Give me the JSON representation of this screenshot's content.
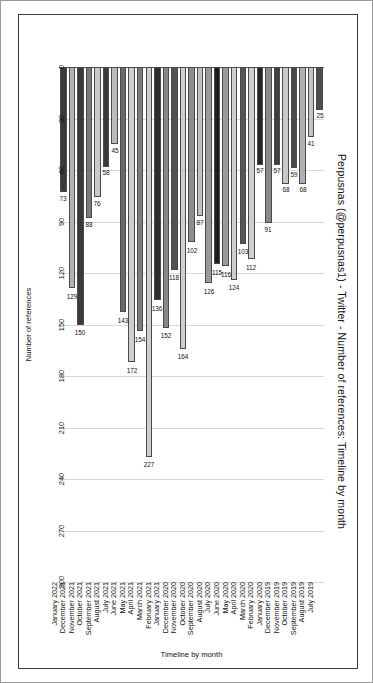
{
  "chart_data": {
    "type": "bar",
    "orientation": "horizontal",
    "title": "Perpusnas (@perpusnas1) - Twitter - Number of references: Timeline by month",
    "xlabel": "Timeline by month",
    "ylabel": "Number of references",
    "ylim": [
      0,
      300
    ],
    "yticks": [
      0,
      30,
      60,
      90,
      120,
      150,
      180,
      210,
      240,
      270,
      300
    ],
    "ytick_labels": [
      "0",
      "30",
      "60",
      "90",
      "120",
      "150",
      "180",
      "210",
      "240",
      "270",
      "300"
    ],
    "grid": true,
    "legend": null,
    "categories": [
      "July 2019",
      "August 2019",
      "September 2019",
      "October 2019",
      "November 2019",
      "December 2019",
      "January 2020",
      "February 2020",
      "March 2020",
      "April 2020",
      "May 2020",
      "June 2020",
      "July 2020",
      "August 2020",
      "September 2020",
      "October 2020",
      "November 2020",
      "December 2020",
      "January 2021",
      "February 2021",
      "March 2021",
      "April 2021",
      "May 2021",
      "June 2021",
      "July 2021",
      "August 2021",
      "September 2021",
      "October 2021",
      "November 2021",
      "December 2021",
      "January 2022"
    ],
    "values": [
      25,
      41,
      68,
      59,
      68,
      57,
      91,
      57,
      112,
      103,
      124,
      116,
      115,
      126,
      87,
      102,
      164,
      118,
      152,
      136,
      227,
      154,
      172,
      143,
      45,
      58,
      76,
      88,
      150,
      129,
      73
    ],
    "bar_colors": [
      "#4d4d4d",
      "#c4c4c4",
      "#b0b0b0",
      "#4a4a4a",
      "#c9c9c9",
      "#3f3f3f",
      "#8a8a8a",
      "#262626",
      "#cfcfcf",
      "#555555",
      "#cecece",
      "#9b9b9b",
      "#1c1c1c",
      "#9a9a9a",
      "#c2c2c2",
      "#8d8d8d",
      "#cfcfcf",
      "#525252",
      "#888888",
      "#2c2c2c",
      "#cfcfcf",
      "#7d7d7d",
      "#cfcfcf",
      "#6a6a6a",
      "#bbbbbb",
      "#3a3a3a",
      "#c9c9c9",
      "#7a7a7a",
      "#3a3a3a",
      "#b2b2b2",
      "#3a3a3a"
    ]
  },
  "frame": {
    "border_color": "#3a3a3a",
    "page_border_color": "#9a9a9a",
    "gridline_color": "#d8d8d8",
    "axis_color": "#555555"
  }
}
